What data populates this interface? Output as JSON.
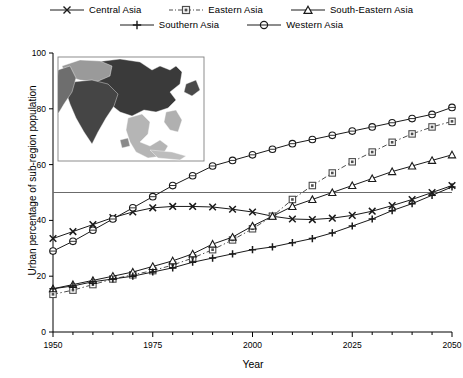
{
  "chart_data": {
    "type": "line",
    "title": "",
    "xlabel": "Year",
    "ylabel": "Urban percentage of sub-region population",
    "xlim": [
      1950,
      2050
    ],
    "ylim": [
      0,
      100
    ],
    "xticks": [
      1950,
      1975,
      2000,
      2025,
      2050
    ],
    "xtick_labels": [
      "1950",
      "1975",
      "2000",
      "2025",
      "2050"
    ],
    "xminor_step": 5,
    "yticks": [
      0,
      20,
      40,
      60,
      80,
      100
    ],
    "ytick_labels": [
      "0",
      "20",
      "40",
      "60",
      "80",
      "100"
    ],
    "grid": false,
    "legend_position": "above-plot",
    "reference_lines": [
      {
        "name": "fifty-percent-line",
        "orientation": "horizontal",
        "value": 50,
        "color": "#6b6b6b"
      }
    ],
    "x": [
      1950,
      1955,
      1960,
      1965,
      1970,
      1975,
      1980,
      1985,
      1990,
      1995,
      2000,
      2005,
      2010,
      2015,
      2020,
      2025,
      2030,
      2035,
      2040,
      2045,
      2050
    ],
    "series": [
      {
        "name": "Central Asia",
        "marker": "x",
        "linestyle": "solid",
        "color": "#1a1a1a",
        "values": [
          33.5,
          36.0,
          38.5,
          41.0,
          43.0,
          44.5,
          45.0,
          45.0,
          44.8,
          44.0,
          43.0,
          41.5,
          40.5,
          40.3,
          40.8,
          41.8,
          43.3,
          45.3,
          47.5,
          50.0,
          52.5
        ]
      },
      {
        "name": "Eastern Asia",
        "marker": "square",
        "linestyle": "dash-dot",
        "color": "#4d4d4d",
        "values": [
          13.5,
          15.0,
          17.0,
          19.0,
          20.5,
          22.0,
          24.0,
          26.5,
          29.5,
          33.0,
          37.0,
          41.5,
          47.5,
          52.5,
          57.0,
          61.0,
          64.5,
          68.0,
          71.0,
          73.5,
          75.5
        ]
      },
      {
        "name": "South-Eastern Asia",
        "marker": "triangle",
        "linestyle": "solid",
        "color": "#1a1a1a",
        "values": [
          15.5,
          17.0,
          18.5,
          20.0,
          21.5,
          23.5,
          25.5,
          28.0,
          31.5,
          34.0,
          38.0,
          41.5,
          45.0,
          47.5,
          50.0,
          52.5,
          55.0,
          57.5,
          59.5,
          61.5,
          63.5
        ]
      },
      {
        "name": "Southern Asia",
        "marker": "plus",
        "linestyle": "solid",
        "color": "#1a1a1a",
        "values": [
          15.5,
          16.5,
          18.0,
          19.0,
          20.0,
          21.5,
          23.0,
          25.0,
          26.5,
          28.0,
          29.5,
          30.5,
          32.0,
          33.5,
          35.5,
          38.0,
          40.5,
          43.5,
          46.0,
          49.0,
          52.0
        ]
      },
      {
        "name": "Western Asia",
        "marker": "circle",
        "linestyle": "solid",
        "color": "#1a1a1a",
        "values": [
          29.0,
          32.5,
          36.5,
          40.5,
          44.5,
          48.5,
          52.5,
          56.0,
          59.5,
          61.5,
          63.5,
          65.5,
          67.5,
          69.0,
          70.5,
          72.0,
          73.5,
          75.0,
          76.5,
          78.0,
          80.5
        ]
      }
    ]
  },
  "legend": {
    "rows": [
      [
        {
          "label": "Central Asia",
          "key": "central-asia"
        },
        {
          "label": "Eastern Asia",
          "key": "eastern-asia"
        },
        {
          "label": "South-Eastern Asia",
          "key": "south-eastern-asia"
        }
      ],
      [
        {
          "label": "Southern Asia",
          "key": "southern-asia"
        },
        {
          "label": "Western Asia",
          "key": "western-asia"
        }
      ]
    ]
  },
  "inset": {
    "name": "asia-subregions-map",
    "description": "Grayscale map of Asia sub-regions"
  }
}
